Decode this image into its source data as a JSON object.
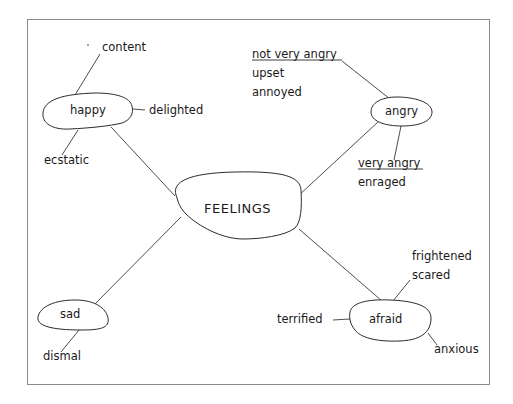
{
  "diagram": {
    "type": "mind-map",
    "center": {
      "label": "FEELINGS"
    },
    "nodes": {
      "happy": {
        "label": "happy"
      },
      "angry": {
        "label": "angry"
      },
      "sad": {
        "label": "sad"
      },
      "afraid": {
        "label": "afraid"
      }
    },
    "leaves": {
      "content": "content",
      "delighted": "delighted",
      "ecstatic": "ecstatic",
      "not_very_angry": "not very angry",
      "upset": "upset",
      "annoyed": "annoyed",
      "very_angry": "very angry",
      "enraged": "enraged",
      "dismal": "dismal",
      "frightened": "frightened",
      "scared": "scared",
      "terrified": "terrified",
      "anxious": "anxious"
    }
  }
}
